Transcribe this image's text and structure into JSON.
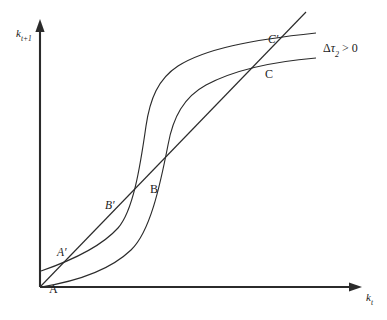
{
  "figure": {
    "kind": "phase-diagram",
    "background_color": "#ffffff",
    "ink_color": "#2b2b2b",
    "width": 387,
    "height": 320
  },
  "axes": {
    "y_label_base": "k",
    "y_label_sub": "t+1",
    "x_label_base": "k",
    "x_label_sub": "t",
    "origin": {
      "x": 40,
      "y": 287
    },
    "y_axis_top": {
      "x": 40,
      "y": 22
    },
    "x_axis_right": {
      "x": 362,
      "y": 287
    },
    "arrowhead": "solid-triangle"
  },
  "annotation": {
    "delta": "Δ",
    "tau": "τ",
    "tau_sub": "2",
    "relation": "> 0",
    "full_text": "Δτ₂ > 0"
  },
  "points": [
    {
      "id": "A",
      "label": "A",
      "styled": "plain",
      "x": 49,
      "y": 283
    },
    {
      "id": "Ap",
      "label": "A′",
      "styled": "primed",
      "x": 57,
      "y": 247
    },
    {
      "id": "B",
      "label": "B",
      "styled": "plain",
      "x": 150,
      "y": 183
    },
    {
      "id": "Bp",
      "label": "B′",
      "styled": "primed",
      "x": 105,
      "y": 200
    },
    {
      "id": "C",
      "label": "C",
      "styled": "plain",
      "x": 265,
      "y": 68
    },
    {
      "id": "Cp",
      "label": "C′",
      "styled": "primed",
      "x": 268,
      "y": 34
    }
  ],
  "curves": [
    {
      "name": "shifted-policy-curve",
      "role": "after tax increase",
      "path": "M 41 271 C 70 261, 100 248, 118 228 C 133 211, 140 168, 146 126 C 150 99, 158 79, 178 66 C 205 49, 250 40, 316 33"
    },
    {
      "name": "initial-policy-curve",
      "role": "before tax increase",
      "path": "M 41 287 C 72 282, 108 272, 131 250 C 150 232, 160 186, 168 145 C 173 117, 184 97, 206 85 C 234 70, 268 62, 316 58"
    }
  ],
  "diagonal": {
    "name": "45-degree-line",
    "from": {
      "x": 40,
      "y": 287
    },
    "to": {
      "x": 306,
      "y": 12
    }
  }
}
